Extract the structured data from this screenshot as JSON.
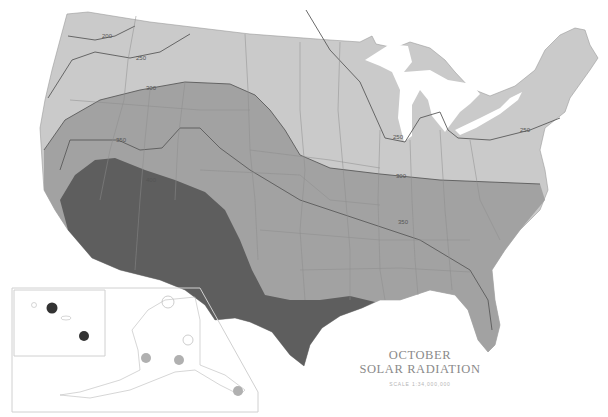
{
  "map": {
    "title_line1": "OCTOBER",
    "title_line2": "SOLAR RADIATION",
    "scale": "SCALE 1:34,000,000",
    "legend_zones": [
      {
        "name": "zone-lowest",
        "color": "#c9c9c9"
      },
      {
        "name": "zone-mid",
        "color": "#9e9e9e"
      },
      {
        "name": "zone-high",
        "color": "#5c5c5c"
      }
    ],
    "contour_labels": [
      {
        "value": "200",
        "x": 105,
        "y": 38
      },
      {
        "value": "250",
        "x": 140,
        "y": 58
      },
      {
        "value": "300",
        "x": 150,
        "y": 89
      },
      {
        "value": "350",
        "x": 120,
        "y": 140
      },
      {
        "value": "400",
        "x": 148,
        "y": 182
      },
      {
        "value": "250",
        "x": 395,
        "y": 138
      },
      {
        "value": "300",
        "x": 398,
        "y": 176
      },
      {
        "value": "250",
        "x": 525,
        "y": 131
      },
      {
        "value": "350",
        "x": 402,
        "y": 223
      }
    ],
    "insets": {
      "hawaii": "Hawaii inset",
      "alaska": "Alaska inset"
    }
  }
}
